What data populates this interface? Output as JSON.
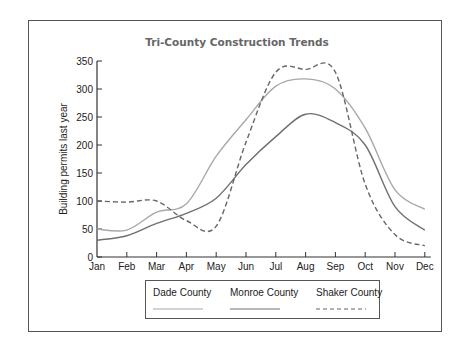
{
  "chart_data": {
    "type": "line",
    "title": "Tri-County Construction Trends",
    "xlabel": "",
    "ylabel": "Building permits last year",
    "ylim": [
      0,
      350
    ],
    "yticks": [
      0,
      50,
      100,
      150,
      200,
      250,
      300,
      350
    ],
    "categories": [
      "Jan",
      "Feb",
      "Mar",
      "Apr",
      "May",
      "Jun",
      "Jul",
      "Aug",
      "Sep",
      "Oct",
      "Nov",
      "Dec"
    ],
    "grid": false,
    "legend_position": "bottom",
    "series": [
      {
        "name": "Dade County",
        "style": "solid",
        "color": "#a8a8a8",
        "values": [
          50,
          48,
          80,
          95,
          180,
          245,
          305,
          318,
          300,
          230,
          120,
          85
        ]
      },
      {
        "name": "Monroe County",
        "style": "solid",
        "color": "#707070",
        "values": [
          30,
          38,
          60,
          78,
          105,
          165,
          215,
          255,
          240,
          200,
          90,
          48
        ]
      },
      {
        "name": "Shaker County",
        "style": "dashed",
        "color": "#666666",
        "values": [
          100,
          98,
          100,
          65,
          55,
          205,
          330,
          335,
          330,
          130,
          40,
          20
        ]
      }
    ]
  }
}
